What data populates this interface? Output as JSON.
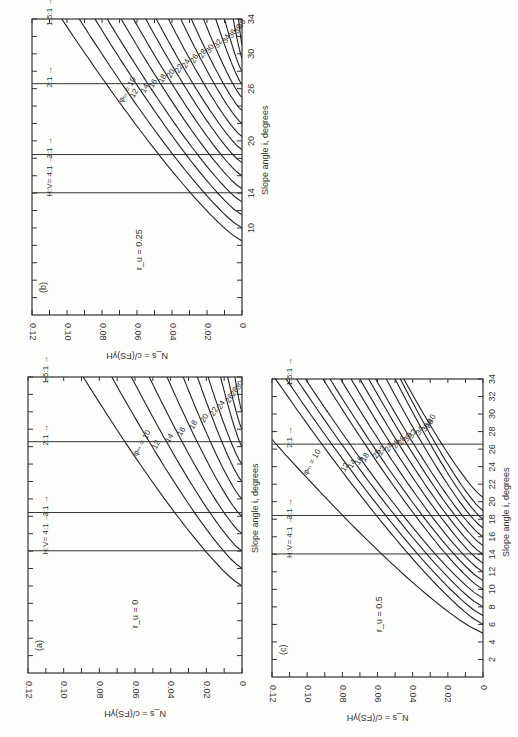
{
  "page": {
    "background": "#fdfdfc",
    "ink": "#222222"
  },
  "chart_data": [
    {
      "id": "b",
      "type": "line",
      "panel_label": "(b)",
      "title": "",
      "ru_label": "r_u = 0.25",
      "xlabel": "Slope angle i, degrees",
      "ylabel": "N_s = c/(FS)γH",
      "xlim": [
        0,
        34
      ],
      "ylim": [
        0,
        0.12
      ],
      "x_tick_labels": [
        "10",
        "14",
        "20",
        "26",
        "30",
        "34"
      ],
      "y_tick_labels": [
        "0.12",
        "0.10",
        "0.08",
        "0.06",
        "0.04",
        "0.02",
        "0"
      ],
      "slope_ratio_lines": [
        {
          "label": "H:V= 4:1",
          "angle": 14.04
        },
        {
          "label": "3:1",
          "angle": 18.43
        },
        {
          "label": "2:1",
          "angle": 26.57
        },
        {
          "label": "1.5:1",
          "angle": 33.69
        }
      ],
      "curve_param": "φ_m",
      "series": [
        {
          "name": "10",
          "zero_at": 8.5,
          "value_at_34": 0.103
        },
        {
          "name": "12",
          "zero_at": 10.0,
          "value_at_34": 0.093
        },
        {
          "name": "14",
          "zero_at": 11.5,
          "value_at_34": 0.084
        },
        {
          "name": "16",
          "zero_at": 13.0,
          "value_at_34": 0.077
        },
        {
          "name": "18",
          "zero_at": 14.5,
          "value_at_34": 0.069
        },
        {
          "name": "20",
          "zero_at": 16.0,
          "value_at_34": 0.062
        },
        {
          "name": "22",
          "zero_at": 17.5,
          "value_at_34": 0.055
        },
        {
          "name": "24",
          "zero_at": 19.0,
          "value_at_34": 0.049
        },
        {
          "name": "26",
          "zero_at": 20.5,
          "value_at_34": 0.042
        },
        {
          "name": "28",
          "zero_at": 22.0,
          "value_at_34": 0.035
        },
        {
          "name": "30",
          "zero_at": 23.5,
          "value_at_34": 0.029
        },
        {
          "name": "32",
          "zero_at": 25.0,
          "value_at_34": 0.022
        },
        {
          "name": "34",
          "zero_at": 26.5,
          "value_at_34": 0.015
        },
        {
          "name": "36",
          "zero_at": 28.0,
          "value_at_34": 0.01
        },
        {
          "name": "38",
          "zero_at": 29.5,
          "value_at_34": 0.005
        },
        {
          "name": "40",
          "zero_at": 31.0,
          "value_at_34": 0.002
        }
      ]
    },
    {
      "id": "a",
      "type": "line",
      "panel_label": "(a)",
      "title": "",
      "ru_label": "r_u = 0",
      "xlabel": "Slope angle i, degrees",
      "ylabel": "N_s = c/(FS)γH",
      "xlim": [
        0,
        34
      ],
      "ylim": [
        0,
        0.12
      ],
      "x_tick_labels": [],
      "y_tick_labels": [
        "0.12",
        "0.10",
        "0.08",
        "0.06",
        "0.04",
        "0.02",
        "0"
      ],
      "slope_ratio_lines": [
        {
          "label": "H:V= 4:1",
          "angle": 14.04
        },
        {
          "label": "3:1",
          "angle": 18.43
        },
        {
          "label": "2:1",
          "angle": 26.57
        },
        {
          "label": "1.5:1",
          "angle": 33.69
        }
      ],
      "curve_param": "φ_m",
      "series": [
        {
          "name": "10",
          "zero_at": 10,
          "value_at_34": 0.089
        },
        {
          "name": "12",
          "zero_at": 12,
          "value_at_34": 0.073
        },
        {
          "name": "14",
          "zero_at": 14,
          "value_at_34": 0.062
        },
        {
          "name": "16",
          "zero_at": 16,
          "value_at_34": 0.052
        },
        {
          "name": "18",
          "zero_at": 18,
          "value_at_34": 0.042
        },
        {
          "name": "20",
          "zero_at": 20,
          "value_at_34": 0.033
        },
        {
          "name": "22",
          "zero_at": 22,
          "value_at_34": 0.025
        },
        {
          "name": "24",
          "zero_at": 24,
          "value_at_34": 0.019
        },
        {
          "name": "26",
          "zero_at": 26,
          "value_at_34": 0.012
        },
        {
          "name": "28",
          "zero_at": 28,
          "value_at_34": 0.008
        },
        {
          "name": "30",
          "zero_at": 30,
          "value_at_34": 0.004
        }
      ]
    },
    {
      "id": "c",
      "type": "line",
      "panel_label": "(c)",
      "title": "",
      "ru_label": "r_u = 0.5",
      "xlabel": "Slope angle i, degrees",
      "ylabel": "N_s = c/(FS)γH",
      "xlim": [
        0,
        34
      ],
      "ylim": [
        0,
        0.12
      ],
      "x_tick_labels": [
        "2",
        "4",
        "6",
        "8",
        "10",
        "12",
        "14",
        "16",
        "18",
        "20",
        "22",
        "24",
        "26",
        "28",
        "30",
        "32",
        "34"
      ],
      "y_tick_labels": [
        "0.12",
        "0.10",
        "0.08",
        "0.06",
        "0.04",
        "0.02",
        "0"
      ],
      "slope_ratio_lines": [
        {
          "label": "H:V= 4:1",
          "angle": 14.04
        },
        {
          "label": "3:1",
          "angle": 18.43
        },
        {
          "label": "2:1",
          "angle": 26.57
        },
        {
          "label": "1.5:1",
          "angle": 33.69
        }
      ],
      "curve_param": "φ_m",
      "series": [
        {
          "name": "10",
          "zero_at": 5.0,
          "value_at_34": 0.15
        },
        {
          "name": "12",
          "zero_at": 6.0,
          "value_at_34": 0.118
        },
        {
          "name": "14",
          "zero_at": 7.0,
          "value_at_34": 0.112
        },
        {
          "name": "16",
          "zero_at": 8.0,
          "value_at_34": 0.106
        },
        {
          "name": "18",
          "zero_at": 9.0,
          "value_at_34": 0.101
        },
        {
          "name": "20",
          "zero_at": 10.0,
          "value_at_34": 0.091
        },
        {
          "name": "22",
          "zero_at": 11.0,
          "value_at_34": 0.087
        },
        {
          "name": "24",
          "zero_at": 12.0,
          "value_at_34": 0.081
        },
        {
          "name": "26",
          "zero_at": 13.0,
          "value_at_34": 0.075
        },
        {
          "name": "28",
          "zero_at": 14.0,
          "value_at_34": 0.07
        },
        {
          "name": "30",
          "zero_at": 15.0,
          "value_at_34": 0.065
        },
        {
          "name": "32",
          "zero_at": 16.0,
          "value_at_34": 0.061
        },
        {
          "name": "34",
          "zero_at": 17.0,
          "value_at_34": 0.055
        },
        {
          "name": "36",
          "zero_at": 18.0,
          "value_at_34": 0.05
        },
        {
          "name": "38",
          "zero_at": 19.0,
          "value_at_34": 0.047
        },
        {
          "name": "40",
          "zero_at": 20.5,
          "value_at_34": 0.045
        }
      ]
    }
  ],
  "layout": {
    "panels": {
      "b": {
        "left": 32,
        "right": 242,
        "top": 19,
        "bottom": 315
      },
      "a": {
        "left": 28,
        "right": 242,
        "top": 377,
        "bottom": 673
      },
      "c": {
        "left": 272,
        "right": 483,
        "top": 379,
        "bottom": 677
      }
    }
  }
}
